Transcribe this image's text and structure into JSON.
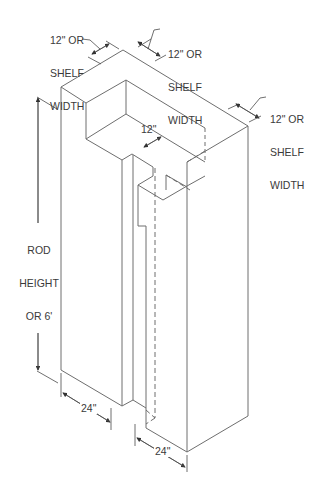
{
  "diagram": {
    "type": "isometric closet dimension drawing",
    "line_color": "#6e6e6e",
    "labels": {
      "top_left_depth": [
        "12\" OR",
        "SHELF",
        "WIDTH"
      ],
      "top_mid_depth": [
        "12\" OR",
        "SHELF",
        "WIDTH"
      ],
      "right_depth": [
        "12\" OR",
        "SHELF",
        "WIDTH"
      ],
      "inner_gap": "12\"",
      "height": [
        "ROD",
        "HEIGHT",
        "OR 6'"
      ],
      "left_width": "24\"",
      "right_width": "24\""
    }
  }
}
